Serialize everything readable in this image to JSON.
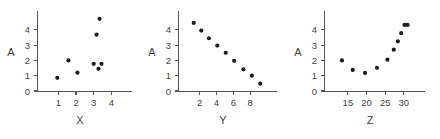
{
  "figure": {
    "background_color": "#ffffff",
    "point_color": "#1c1c1c",
    "axis_color": "#555555",
    "text_color": "#3f3f3f",
    "panel_count": 3
  },
  "chart_data": [
    {
      "type": "scatter",
      "title": "",
      "xlabel": "X",
      "ylabel": "A",
      "xlim": [
        0.3,
        4.6
      ],
      "ylim": [
        0,
        5.1
      ],
      "xticks": [
        1,
        2,
        3,
        4
      ],
      "yticks": [
        0,
        1,
        2,
        3,
        4
      ],
      "xticklabels": [
        "1",
        "2",
        "3",
        "4"
      ],
      "yticklabels": [
        "0",
        "1",
        "2",
        "3",
        "4"
      ],
      "grid": false,
      "legend": false,
      "x": [
        0.94,
        1.57,
        2.08,
        3.0,
        3.16,
        3.27,
        3.33,
        3.44
      ],
      "y": [
        0.86,
        2.0,
        1.2,
        1.78,
        3.68,
        1.45,
        4.72,
        1.78
      ]
    },
    {
      "type": "scatter",
      "title": "",
      "xlabel": "Y",
      "ylabel": "A",
      "xlim": [
        0.5,
        10.0
      ],
      "ylim": [
        0,
        5.1
      ],
      "xticks": [
        2,
        4,
        6,
        8
      ],
      "yticks": [
        0,
        1,
        2,
        3,
        4
      ],
      "xticklabels": [
        "2",
        "4",
        "6",
        "8"
      ],
      "yticklabels": [
        "0",
        "1",
        "2",
        "3",
        "4"
      ],
      "grid": false,
      "legend": false,
      "x": [
        1.3,
        2.2,
        3.1,
        4.1,
        5.1,
        6.1,
        7.2,
        8.2,
        9.2
      ],
      "y": [
        4.45,
        3.95,
        3.45,
        2.97,
        2.5,
        1.97,
        1.42,
        1.0,
        0.48
      ]
    },
    {
      "type": "scatter",
      "title": "",
      "xlabel": "Z",
      "ylabel": "A",
      "xlim": [
        11,
        33
      ],
      "ylim": [
        0,
        5.1
      ],
      "xticks": [
        15,
        20,
        25,
        30
      ],
      "yticks": [
        0,
        1,
        2,
        3,
        4
      ],
      "xticklabels": [
        "15",
        "20",
        "25",
        "30"
      ],
      "yticklabels": [
        "0",
        "1",
        "2",
        "3",
        "4"
      ],
      "grid": false,
      "legend": false,
      "x": [
        13.4,
        16.3,
        19.6,
        22.8,
        25.6,
        27.3,
        28.4,
        29.3,
        30.2,
        31.0
      ],
      "y": [
        2.0,
        1.38,
        1.18,
        1.52,
        2.05,
        2.7,
        3.25,
        3.78,
        4.32,
        4.32
      ]
    }
  ],
  "panels": [
    {
      "name": "panel-x",
      "xlabel": "X",
      "ylabel": "A",
      "offset_x": 0
    },
    {
      "name": "panel-y",
      "xlabel": "Y",
      "ylabel": "A",
      "offset_x": 147
    },
    {
      "name": "panel-z",
      "xlabel": "Z",
      "ylabel": "A",
      "offset_x": 293
    }
  ]
}
